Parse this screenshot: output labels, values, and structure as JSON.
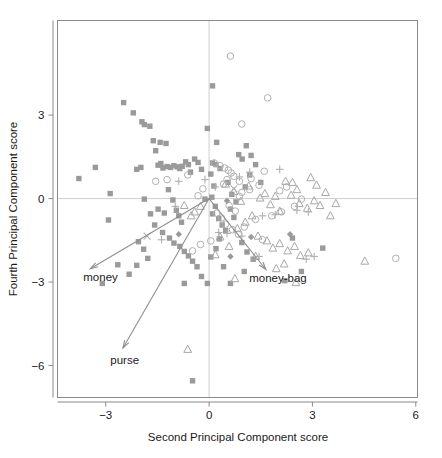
{
  "figure": {
    "width": 442,
    "height": 458
  },
  "chart_data": {
    "type": "scatter",
    "title": "",
    "xlabel": "Second Principal Component score",
    "ylabel": "Fourth Principal Component score",
    "xlim": [
      -4.4,
      6.05
    ],
    "ylim": [
      -7.15,
      6.4
    ],
    "xticks": [
      -3,
      0,
      3,
      6
    ],
    "xticklabels": [
      "−3",
      "0",
      "3",
      "6"
    ],
    "yticks": [
      3,
      0,
      -3,
      -6
    ],
    "yticklabels": [
      "3",
      "0",
      "−3",
      "−6"
    ],
    "grid": false,
    "zero_lines": {
      "x": 0,
      "y": 0,
      "color": "#c9c9c9"
    },
    "legend": null,
    "colors": {
      "square": "#9a9a9a",
      "circle": "#b0b0b0",
      "triangle": "#a8a8a8",
      "plus": "#b0b0b0",
      "arrow": "#8f8f8f",
      "frame": "#8a8a8a",
      "text": "#1a1a1a"
    },
    "annotations": [
      {
        "label": "money",
        "origin": [
          0,
          0
        ],
        "tip": [
          -3.45,
          -2.52
        ],
        "label_xy": [
          -3.15,
          -2.95
        ]
      },
      {
        "label": "purse",
        "origin": [
          0,
          0
        ],
        "tip": [
          -2.5,
          -5.37
        ],
        "label_xy": [
          -2.45,
          -5.95
        ]
      },
      {
        "label": "money-bag",
        "origin": [
          0,
          0
        ],
        "tip": [
          1.65,
          -2.55
        ],
        "label_xy": [
          2.0,
          -3.0
        ]
      }
    ],
    "series": [
      {
        "name": "square",
        "marker": "filled-square",
        "points": [
          [
            -3.78,
            0.72
          ],
          [
            -3.3,
            1.12
          ],
          [
            -2.87,
            0.18
          ],
          [
            -2.92,
            -0.77
          ],
          [
            -2.65,
            -2.38
          ],
          [
            -3.1,
            -3.05
          ],
          [
            -2.48,
            3.45
          ],
          [
            -2.2,
            3.08
          ],
          [
            -1.95,
            2.76
          ],
          [
            -1.88,
            2.66
          ],
          [
            -1.72,
            2.6
          ],
          [
            -1.62,
            2.08
          ],
          [
            -1.55,
            1.72
          ],
          [
            -1.48,
            1.2
          ],
          [
            -1.4,
            1.26
          ],
          [
            -1.34,
            1.1
          ],
          [
            -1.22,
            1.15
          ],
          [
            -1.12,
            1.12
          ],
          [
            -1.02,
            1.18
          ],
          [
            -0.92,
            1.14
          ],
          [
            -0.85,
            1.08
          ],
          [
            -0.78,
            1.16
          ],
          [
            -0.68,
            1.32
          ],
          [
            -0.6,
            1.22
          ],
          [
            -0.54,
            0.95
          ],
          [
            -1.18,
            0.32
          ],
          [
            -1.05,
            -0.05
          ],
          [
            -0.95,
            -0.42
          ],
          [
            -0.88,
            -0.62
          ],
          [
            -0.8,
            -0.85
          ],
          [
            -1.3,
            -0.52
          ],
          [
            -1.48,
            -0.38
          ],
          [
            -1.7,
            -0.55
          ],
          [
            -1.58,
            -0.95
          ],
          [
            -1.35,
            -1.22
          ],
          [
            -1.15,
            -1.42
          ],
          [
            -1.02,
            -1.6
          ],
          [
            -0.85,
            -1.72
          ],
          [
            -0.72,
            -1.9
          ],
          [
            -0.6,
            -2.06
          ],
          [
            -2.05,
            -1.55
          ],
          [
            -1.9,
            -1.82
          ],
          [
            -1.78,
            -2.15
          ],
          [
            -2.1,
            -2.4
          ],
          [
            -2.32,
            -2.72
          ],
          [
            -0.48,
            -2.25
          ],
          [
            -0.35,
            -2.45
          ],
          [
            -0.22,
            -2.8
          ],
          [
            -0.72,
            -3.05
          ],
          [
            -0.05,
            -3.05
          ],
          [
            -0.48,
            -6.55
          ],
          [
            0.1,
            4.05
          ],
          [
            0.22,
            2.02
          ],
          [
            0.1,
            1.28
          ],
          [
            0.2,
            1.22
          ],
          [
            0.05,
            0.88
          ],
          [
            0.14,
            0.45
          ],
          [
            0.08,
            0.05
          ],
          [
            0.18,
            -0.28
          ],
          [
            0.1,
            -0.55
          ],
          [
            0.28,
            -0.72
          ],
          [
            0.38,
            -0.95
          ],
          [
            0.48,
            -1.15
          ],
          [
            0.3,
            -1.45
          ],
          [
            0.2,
            -1.8
          ],
          [
            0.05,
            -2.1
          ],
          [
            0.42,
            -2.45
          ],
          [
            0.55,
            0.58
          ],
          [
            0.66,
            0.15
          ],
          [
            0.78,
            -0.12
          ],
          [
            0.62,
            -0.38
          ],
          [
            0.72,
            -0.68
          ],
          [
            0.86,
            1.58
          ],
          [
            0.96,
            1.42
          ],
          [
            1.08,
            1.9
          ],
          [
            1.22,
            1.55
          ],
          [
            1.35,
            1.22
          ],
          [
            1.18,
            0.85
          ],
          [
            1.05,
            0.42
          ],
          [
            1.5,
            0.58
          ],
          [
            0.95,
            -1.58
          ],
          [
            1.1,
            -1.92
          ],
          [
            1.28,
            -2.18
          ],
          [
            1.02,
            -2.62
          ],
          [
            0.62,
            -3.05
          ],
          [
            2.42,
            -1.42
          ],
          [
            2.68,
            -2.62
          ],
          [
            3.3,
            -1.78
          ],
          [
            2.2,
            -2.95
          ],
          [
            -2.1,
            1.05
          ],
          [
            -1.98,
            1.12
          ],
          [
            -0.42,
            1.42
          ],
          [
            -0.32,
            1.3
          ],
          [
            -0.22,
            1.05
          ],
          [
            0.32,
            1.08
          ],
          [
            -1.88,
            -0.02
          ],
          [
            -0.12,
            -0.02
          ],
          [
            -0.05,
            2.52
          ],
          [
            -1.42,
            2.02
          ],
          [
            -1.25,
            1.98
          ]
        ]
      },
      {
        "name": "circle",
        "marker": "open-circle",
        "points": [
          [
            -1.22,
            0.68
          ],
          [
            -0.62,
            0.85
          ],
          [
            0.62,
            5.12
          ],
          [
            1.7,
            3.62
          ],
          [
            0.95,
            2.68
          ],
          [
            0.15,
            1.28
          ],
          [
            0.32,
            1.18
          ],
          [
            0.45,
            1.1
          ],
          [
            0.56,
            1.02
          ],
          [
            0.64,
            0.92
          ],
          [
            0.72,
            0.8
          ],
          [
            0.52,
            0.68
          ],
          [
            0.42,
            0.52
          ],
          [
            0.88,
            0.62
          ],
          [
            1.22,
            0.72
          ],
          [
            1.45,
            0.48
          ],
          [
            1.18,
            0.32
          ],
          [
            0.95,
            0.22
          ],
          [
            1.6,
            0.98
          ],
          [
            2.05,
            0.28
          ],
          [
            2.25,
            0.42
          ],
          [
            2.48,
            -0.28
          ],
          [
            2.1,
            -0.48
          ],
          [
            0.58,
            -0.25
          ],
          [
            0.76,
            -0.45
          ],
          [
            0.48,
            -0.92
          ],
          [
            0.68,
            -1.12
          ],
          [
            0.85,
            -1.28
          ],
          [
            1.02,
            -1.02
          ],
          [
            1.55,
            -1.48
          ],
          [
            -0.18,
            0.35
          ],
          [
            -0.32,
            0.1
          ],
          [
            0.22,
            -0.52
          ],
          [
            0.36,
            -0.7
          ],
          [
            5.42,
            -2.15
          ],
          [
            2.68,
            -0.02
          ],
          [
            -1.55,
            0.62
          ],
          [
            1.82,
            -0.62
          ],
          [
            0.05,
            -1.52
          ],
          [
            -0.25,
            -1.65
          ],
          [
            -0.48,
            -1.88
          ],
          [
            0.88,
            0.08
          ],
          [
            1.35,
            -0.75
          ]
        ]
      },
      {
        "name": "triangle",
        "marker": "open-triangle",
        "points": [
          [
            0.48,
            0.52
          ],
          [
            0.72,
            0.25
          ],
          [
            0.92,
            -0.1
          ],
          [
            1.15,
            0.45
          ],
          [
            1.48,
            0.02
          ],
          [
            1.62,
            0.18
          ],
          [
            1.78,
            -0.22
          ],
          [
            1.92,
            0.08
          ],
          [
            2.05,
            -0.45
          ],
          [
            2.22,
            0.62
          ],
          [
            2.42,
            0.58
          ],
          [
            2.55,
            0.32
          ],
          [
            2.38,
            0.12
          ],
          [
            2.62,
            -0.18
          ],
          [
            2.85,
            -0.35
          ],
          [
            3.05,
            -0.08
          ],
          [
            3.22,
            -0.25
          ],
          [
            3.38,
            0.22
          ],
          [
            3.12,
            0.48
          ],
          [
            2.95,
            0.75
          ],
          [
            1.25,
            -0.62
          ],
          [
            1.05,
            -0.85
          ],
          [
            0.82,
            -1.08
          ],
          [
            1.42,
            -1.35
          ],
          [
            1.68,
            -1.52
          ],
          [
            1.85,
            -1.78
          ],
          [
            2.05,
            -1.62
          ],
          [
            2.28,
            -1.88
          ],
          [
            2.48,
            -1.72
          ],
          [
            2.65,
            -2.05
          ],
          [
            2.18,
            -2.35
          ],
          [
            1.95,
            -2.52
          ],
          [
            4.52,
            -2.25
          ],
          [
            2.52,
            -3.02
          ],
          [
            -0.52,
            -0.62
          ],
          [
            -0.42,
            -0.48
          ],
          [
            0.32,
            -1.38
          ],
          [
            0.58,
            -1.72
          ],
          [
            0.18,
            -2.02
          ],
          [
            -0.72,
            -0.25
          ],
          [
            3.52,
            -0.62
          ],
          [
            3.68,
            -0.18
          ],
          [
            2.88,
            -1.95
          ],
          [
            1.35,
            -2.08
          ],
          [
            -0.62,
            -5.42
          ],
          [
            0.75,
            -2.88
          ],
          [
            -0.25,
            -0.28
          ]
        ]
      },
      {
        "name": "plus",
        "marker": "plus",
        "points": [
          [
            -0.88,
            0.62
          ],
          [
            -0.12,
            0.68
          ],
          [
            0.88,
            0.78
          ],
          [
            1.18,
            0.95
          ],
          [
            2.05,
            1.05
          ],
          [
            1.55,
            -0.62
          ],
          [
            1.92,
            -0.58
          ],
          [
            2.55,
            -0.42
          ],
          [
            0.52,
            -1.25
          ],
          [
            0.95,
            -1.35
          ],
          [
            -0.98,
            -0.28
          ],
          [
            0.28,
            -1.22
          ],
          [
            2.88,
            -0.48
          ],
          [
            1.45,
            -2.08
          ],
          [
            2.82,
            -2.18
          ],
          [
            -1.38,
            -1.48
          ],
          [
            0.18,
            0.42
          ],
          [
            3.05,
            -2.08
          ]
        ]
      },
      {
        "name": "diamond",
        "marker": "filled-diamond",
        "points": [
          [
            0.52,
            -0.08
          ],
          [
            1.22,
            -1.38
          ],
          [
            2.35,
            -1.28
          ],
          [
            -0.88,
            -1.28
          ],
          [
            0.62,
            -2.08
          ]
        ]
      },
      {
        "name": "cross",
        "marker": "x-cross",
        "points": [
          [
            -1.8,
            -1.35
          ],
          [
            0.72,
            0.35
          ]
        ]
      }
    ]
  }
}
